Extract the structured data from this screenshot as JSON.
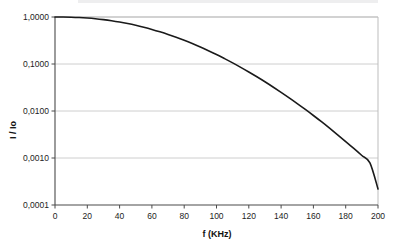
{
  "chart_data": {
    "type": "line",
    "title": "",
    "xlabel": "f (KHz)",
    "ylabel": "I / Io",
    "xlim": [
      0,
      200
    ],
    "ylim": [
      0.0001,
      1
    ],
    "yscale": "log",
    "xscale": "linear",
    "grid": "horizontal",
    "legend": "none",
    "decimal_separator": ",",
    "xticks": [
      0,
      20,
      40,
      60,
      80,
      100,
      120,
      140,
      160,
      180,
      200
    ],
    "xtick_labels": [
      "0",
      "20",
      "40",
      "60",
      "80",
      "100",
      "120",
      "140",
      "160",
      "180",
      "200"
    ],
    "yticks": [
      1,
      0.1,
      0.01,
      0.001,
      0.0001
    ],
    "ytick_labels": [
      "1,0000",
      "0,1000",
      "0,0100",
      "0,0010",
      "0,0001"
    ],
    "series": [
      {
        "name": "I / Io",
        "color": "#1a1a1a",
        "line_width": 1.6,
        "x": [
          0,
          5,
          10,
          15,
          20,
          25,
          30,
          35,
          40,
          45,
          50,
          55,
          60,
          65,
          70,
          75,
          80,
          85,
          90,
          95,
          100,
          105,
          110,
          115,
          120,
          125,
          130,
          135,
          140,
          145,
          150,
          155,
          160,
          165,
          170,
          175,
          180,
          185,
          190,
          195,
          200
        ],
        "y": [
          1.0,
          0.998,
          0.99,
          0.975,
          0.95,
          0.918,
          0.878,
          0.832,
          0.78,
          0.724,
          0.665,
          0.604,
          0.543,
          0.483,
          0.425,
          0.37,
          0.319,
          0.272,
          0.23,
          0.192,
          0.159,
          0.13,
          0.1055,
          0.0848,
          0.0676,
          0.0534,
          0.0418,
          0.0324,
          0.0249,
          0.019,
          0.0144,
          0.0108,
          0.00802,
          0.00591,
          0.00431,
          0.00312,
          0.00224,
          0.0016,
          0.00113,
          0.000786,
          0.00022
        ]
      }
    ],
    "annotations": []
  },
  "axes": {
    "y_axis_title": "I / Io",
    "x_axis_title": "f (KHz)"
  },
  "colors": {
    "curve": "#1a1a1a",
    "gridline": "#c8c8c8",
    "axis": "#4a4a4a",
    "frame": "#bdbdbd",
    "background": "#ffffff",
    "text": "#1a1a1a"
  }
}
